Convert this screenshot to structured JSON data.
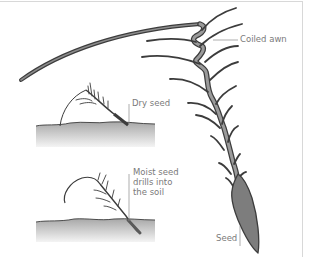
{
  "diagram": {
    "labels": {
      "coiled_awn": "Coiled awn",
      "dry_seed": "Dry seed",
      "moist_seed": "Moist seed drills into the soil",
      "seed": "Seed"
    },
    "colors": {
      "awn_fill": "#8c8c8c",
      "awn_stroke": "#3c3c3c",
      "seed_fill": "#7d7d7d",
      "soil_top": "#a8a8a8",
      "soil_bottom": "#f2f2f2",
      "label_text": "#7a7a7a",
      "leader_line": "#8a8a8a",
      "frame_border": "#d8d8d8"
    }
  }
}
